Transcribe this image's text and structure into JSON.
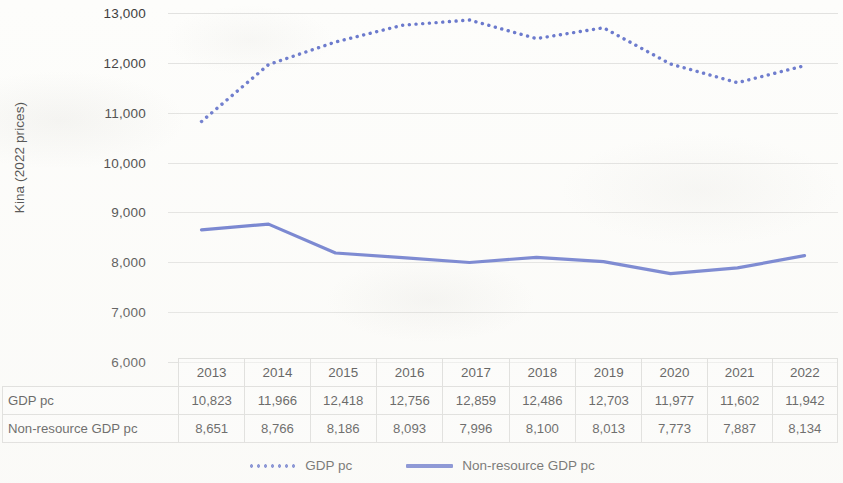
{
  "axis": {
    "y_title": "Kina (2022 prices)",
    "y_ticks": [
      "13,000",
      "12,000",
      "11,000",
      "10,000",
      "9,000",
      "8,000",
      "7,000",
      "6,000"
    ]
  },
  "legend": {
    "items": [
      {
        "label": "GDP pc",
        "style": "dotted",
        "color": "#5b6bc8"
      },
      {
        "label": "Non-resource GDP pc",
        "style": "solid",
        "color": "#5b6bc8"
      }
    ]
  },
  "table": {
    "columns": [
      "2013",
      "2014",
      "2015",
      "2016",
      "2017",
      "2018",
      "2019",
      "2020",
      "2021",
      "2022"
    ],
    "rows": [
      {
        "label": "GDP pc",
        "values": [
          "10,823",
          "11,966",
          "12,418",
          "12,756",
          "12,859",
          "12,486",
          "12,703",
          "11,977",
          "11,602",
          "11,942"
        ]
      },
      {
        "label": "Non-resource GDP pc",
        "values": [
          "8,651",
          "8,766",
          "8,186",
          "8,093",
          "7,996",
          "8,100",
          "8,013",
          "7,773",
          "7,887",
          "8,134"
        ]
      }
    ]
  },
  "chart_data": {
    "type": "line",
    "title": "",
    "xlabel": "",
    "ylabel": "Kina (2022 prices)",
    "categories": [
      "2013",
      "2014",
      "2015",
      "2016",
      "2017",
      "2018",
      "2019",
      "2020",
      "2021",
      "2022"
    ],
    "ylim": [
      6000,
      13000
    ],
    "ytick_step": 1000,
    "grid": "horizontal",
    "legend_position": "bottom",
    "series": [
      {
        "name": "GDP pc",
        "style": "dotted",
        "color": "#5b6bc8",
        "values": [
          10823,
          11966,
          12418,
          12756,
          12859,
          12486,
          12703,
          11977,
          11602,
          11942
        ]
      },
      {
        "name": "Non-resource GDP pc",
        "style": "solid",
        "color": "#5b6bc8",
        "values": [
          8651,
          8766,
          8186,
          8093,
          7996,
          8100,
          8013,
          7773,
          7887,
          8134
        ]
      }
    ]
  }
}
